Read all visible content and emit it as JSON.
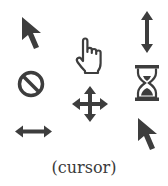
{
  "figure": {
    "caption": "(cursor)",
    "icon_color": "#3d3d3d",
    "icons": [
      {
        "name": "arrow-pointer",
        "row": 1,
        "col": 1
      },
      {
        "name": "hand-pointer",
        "row": 1,
        "col": 2
      },
      {
        "name": "vertical-resize",
        "row": 1,
        "col": 3
      },
      {
        "name": "not-allowed",
        "row": 2,
        "col": 1
      },
      {
        "name": "move",
        "row": 2,
        "col": 2
      },
      {
        "name": "hourglass-busy",
        "row": 2,
        "col": 3
      },
      {
        "name": "horizontal-resize",
        "row": 3,
        "col": 1
      },
      {
        "name": "arrow-pointer",
        "row": 3,
        "col": 3
      }
    ]
  }
}
